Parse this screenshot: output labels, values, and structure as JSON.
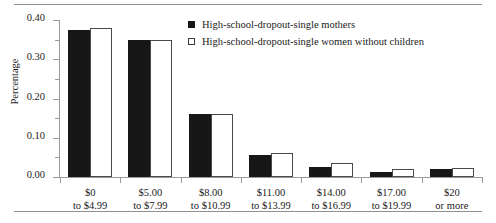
{
  "chart_data": {
    "type": "bar",
    "title": "",
    "xlabel": "",
    "ylabel": "Percentage",
    "ylim": [
      0.0,
      0.4
    ],
    "ytick_labels": [
      "0.00",
      "0.10",
      "0.20",
      "0.30",
      "0.40"
    ],
    "ytick_values": [
      0.0,
      0.1,
      0.2,
      0.3,
      0.4
    ],
    "yminor_values": [
      0.05,
      0.15,
      0.25,
      0.35
    ],
    "grid": false,
    "legend_position": "top-right",
    "categories": [
      "$0\nto $4.99",
      "$5.00\nto $7.99",
      "$8.00\nto $10.99",
      "$11.00\nto $13.99",
      "$14.00\nto $16.99",
      "$17.00\nto $19.99",
      "$20\nor more"
    ],
    "category_lines": [
      [
        "$0",
        "to $4.99"
      ],
      [
        "$5.00",
        "to $7.99"
      ],
      [
        "$8.00",
        "to $10.99"
      ],
      [
        "$11.00",
        "to $13.99"
      ],
      [
        "$14.00",
        "to $16.99"
      ],
      [
        "$17.00",
        "to $19.99"
      ],
      [
        "$20",
        "or more"
      ]
    ],
    "series": [
      {
        "name": "High-school-dropout-single mothers",
        "style": "filled",
        "color": "#171717",
        "values": [
          0.375,
          0.35,
          0.16,
          0.055,
          0.025,
          0.012,
          0.021
        ]
      },
      {
        "name": "High-school-dropout-single women without children",
        "style": "open",
        "color": "#ffffff",
        "values": [
          0.38,
          0.35,
          0.16,
          0.06,
          0.035,
          0.02,
          0.022
        ]
      }
    ]
  },
  "legend": {
    "items": [
      {
        "label": "High-school-dropout-single mothers",
        "style": "filled"
      },
      {
        "label": "High-school-dropout-single women without children",
        "style": "open"
      }
    ]
  },
  "axis": {
    "y_title": "Percentage"
  }
}
